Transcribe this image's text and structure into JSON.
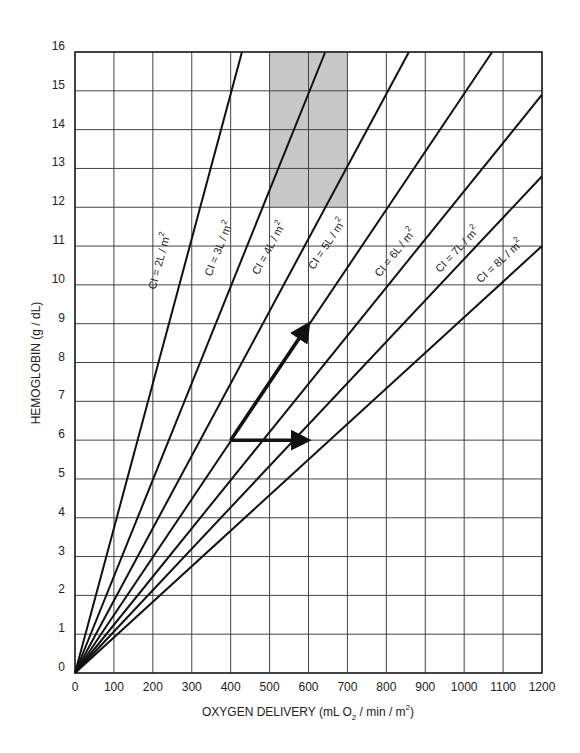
{
  "chart_data": {
    "type": "line",
    "title": "",
    "xlabel": "OXYGEN DELIVERY (mL O2 / min / m2)",
    "xlabel_parts": {
      "main": "OXYGEN DELIVERY (mL O",
      "sub": "2",
      "mid": "  / min / m",
      "sup": "2",
      "end": ")"
    },
    "ylabel": "HEMOGLOBIN (g / dL)",
    "xlim": [
      0,
      1200
    ],
    "ylim": [
      0,
      16
    ],
    "x_ticks": [
      0,
      100,
      200,
      300,
      400,
      500,
      600,
      700,
      800,
      900,
      1000,
      1100,
      1200
    ],
    "y_ticks": [
      0,
      1,
      2,
      3,
      4,
      5,
      6,
      7,
      8,
      9,
      10,
      11,
      12,
      13,
      14,
      15,
      16
    ],
    "grid": true,
    "legend": "none (inline line labels)",
    "relationship": "Oxygen delivery = CI x Hb x 13.4",
    "series": [
      {
        "name": "CI = 2L / m2",
        "label_main": "CI = 2L / m",
        "ci": 2,
        "x": [
          0,
          429
        ],
        "y": [
          0,
          16
        ]
      },
      {
        "name": "CI = 3L / m2",
        "label_main": "CI = 3L / m",
        "ci": 3,
        "x": [
          0,
          643
        ],
        "y": [
          0,
          16
        ]
      },
      {
        "name": "CI = 4L / m2",
        "label_main": "CI = 4L / m",
        "ci": 4,
        "x": [
          0,
          858
        ],
        "y": [
          0,
          16
        ]
      },
      {
        "name": "CI = 5L / m2",
        "label_main": "CI = 5L / m",
        "ci": 5,
        "x": [
          0,
          1072
        ],
        "y": [
          0,
          16
        ]
      },
      {
        "name": "CI = 6L / m2",
        "label_main": "CI = 6L / m",
        "ci": 6,
        "x": [
          0,
          1200
        ],
        "y": [
          0,
          14.9
        ]
      },
      {
        "name": "CI = 7L / m2",
        "label_main": "CI = 7L / m",
        "ci": 7,
        "x": [
          0,
          1200
        ],
        "y": [
          0,
          12.8
        ]
      },
      {
        "name": "CI = 8L / m2",
        "label_main": "CI = 8L / m",
        "ci": 8,
        "x": [
          0,
          1200
        ],
        "y": [
          0,
          11.0
        ]
      }
    ],
    "shaded_region": {
      "x": [
        500,
        700
      ],
      "y": [
        12,
        16
      ],
      "color": "#c8c8c8"
    },
    "annotations": [
      {
        "type": "arrow",
        "from": [
          400,
          6
        ],
        "to": [
          600,
          9
        ]
      },
      {
        "type": "arrow",
        "from": [
          400,
          6
        ],
        "to": [
          600,
          6
        ]
      }
    ]
  },
  "colors": {
    "line": "#111111",
    "grid": "#444444",
    "shade": "#c8c8c8"
  }
}
